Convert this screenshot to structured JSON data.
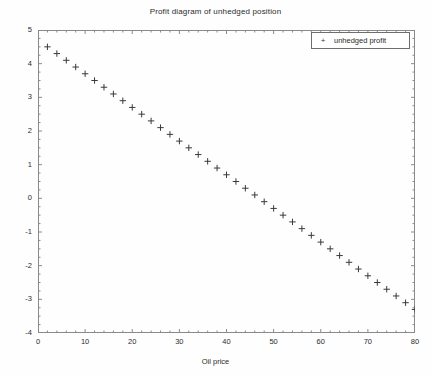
{
  "chart_data": {
    "type": "scatter",
    "title": "Profit diagram of unhedged position",
    "xlabel": "Oil price",
    "ylabel": "Profit",
    "xlim": [
      0,
      80
    ],
    "ylim": [
      -4,
      5
    ],
    "xticks": [
      0,
      10,
      20,
      30,
      40,
      50,
      60,
      70,
      80
    ],
    "yticks": [
      -4,
      -3,
      -2,
      -1,
      0,
      1,
      2,
      3,
      4,
      5
    ],
    "grid": false,
    "legend_position": "upper right",
    "marker": "+",
    "marker_color": "#3a3a3a",
    "series": [
      {
        "name": "unhedged profit",
        "x": [
          2,
          4,
          6,
          8,
          10,
          12,
          14,
          16,
          18,
          20,
          22,
          24,
          26,
          28,
          30,
          32,
          34,
          36,
          38,
          40,
          42,
          44,
          46,
          48,
          50,
          52,
          54,
          56,
          58,
          60,
          62,
          64,
          66,
          68,
          70,
          72,
          74,
          76,
          78,
          80
        ],
        "values": [
          4.5,
          4.3,
          4.1,
          3.9,
          3.7,
          3.5,
          3.3,
          3.1,
          2.9,
          2.7,
          2.5,
          2.3,
          2.1,
          1.9,
          1.7,
          1.5,
          1.3,
          1.1,
          0.9,
          0.7,
          0.5,
          0.3,
          0.1,
          -0.1,
          -0.3,
          -0.5,
          -0.7,
          -0.9,
          -1.1,
          -1.3,
          -1.5,
          -1.7,
          -1.9,
          -2.1,
          -2.3,
          -2.5,
          -2.7,
          -2.9,
          -3.1,
          -3.3
        ]
      }
    ]
  },
  "legend": {
    "marker_glyph": "+",
    "entries": [
      {
        "label": "unhedged profit"
      }
    ]
  },
  "axes": {
    "x_tick_labels": [
      "0",
      "10",
      "20",
      "30",
      "40",
      "50",
      "60",
      "70",
      "80"
    ],
    "y_tick_labels": [
      "5",
      "4",
      "3",
      "2",
      "1",
      "0",
      "-1",
      "-2",
      "-3",
      "-4"
    ]
  }
}
